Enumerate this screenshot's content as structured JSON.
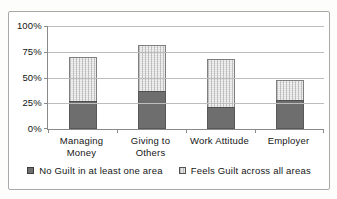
{
  "chart_data": {
    "type": "bar",
    "stacked": true,
    "title": "",
    "categories": [
      "Managing Money",
      "Giving to Others",
      "Work Attitude",
      "Employer"
    ],
    "series": [
      {
        "name": "No Guilt in at least one area",
        "values": [
          27,
          37,
          21,
          28
        ],
        "color": "#6e6e6e"
      },
      {
        "name": "Feels Guilt across all areas",
        "values": [
          43,
          45,
          47,
          20
        ],
        "color": "#e3e3e3"
      }
    ],
    "stack_totals": [
      70,
      82,
      68,
      48
    ],
    "xlabel": "",
    "ylabel": "",
    "y_ticks": [
      "0%",
      "25%",
      "50%",
      "75%",
      "100%"
    ],
    "ylim": [
      0,
      100
    ],
    "grid": true,
    "legend_position": "bottom"
  },
  "colors": {
    "dark_series": "#6e6e6e",
    "light_series": "#e3e3e3",
    "grid": "#bdbdbd",
    "axis": "#8a8a8a",
    "border": "#a9a9a9",
    "text": "#161616"
  }
}
